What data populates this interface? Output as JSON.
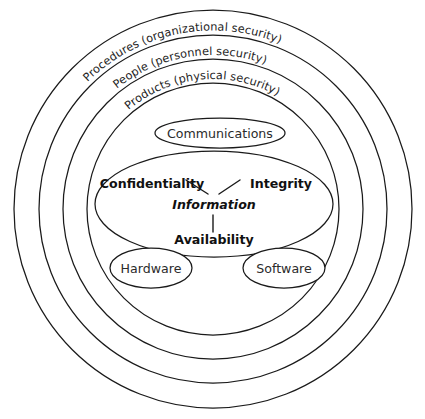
{
  "diagram": {
    "background_color": "#ffffff",
    "stroke_color": "#1a1a1a",
    "text_color": "#232323",
    "rings": [
      {
        "id": "procedures",
        "label": "Procedures (organizational security)",
        "radius": 199,
        "level": 1
      },
      {
        "id": "people",
        "label": "People (personnel security)",
        "radius": 174,
        "level": 2
      },
      {
        "id": "products",
        "label": "Products (physical security)",
        "radius": 150,
        "level": 3
      },
      {
        "id": "inner-boundary",
        "label": "",
        "radius": 126,
        "level": 4
      }
    ],
    "center": {
      "x": 213,
      "y": 209
    },
    "nodes": [
      {
        "id": "communications",
        "label": "Communications",
        "cx": 220,
        "cy": 133,
        "rx": 65,
        "ry": 15
      },
      {
        "id": "information-core",
        "label": "",
        "cx": 214,
        "cy": 204,
        "rx": 119,
        "ry": 53
      },
      {
        "id": "hardware",
        "label": "Hardware",
        "cx": 151,
        "cy": 268,
        "rx": 41,
        "ry": 20
      },
      {
        "id": "software",
        "label": "Software",
        "cx": 284,
        "cy": 268,
        "rx": 41,
        "ry": 20
      }
    ],
    "cia_triad": {
      "confidentiality": "Confidentiality",
      "integrity": "Integrity",
      "availability": "Availability",
      "center": "Information"
    }
  }
}
